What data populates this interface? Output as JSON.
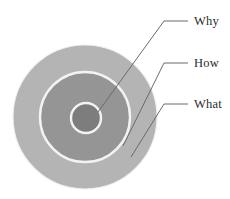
{
  "diagram": {
    "type": "concentric-circles",
    "background_color": "#ffffff",
    "center": {
      "x": 85,
      "y": 117
    },
    "ring_gap_color": "#f2f0ee",
    "rings": [
      {
        "id": "what",
        "label": "What",
        "level": 3,
        "radius": 72,
        "fill": "#b4b4b4",
        "stroke": "#f1efe9",
        "stroke_width": 1.4
      },
      {
        "id": "how",
        "label": "How",
        "level": 2,
        "radius": 45,
        "fill": "#959595",
        "stroke": "#f1efe9",
        "stroke_width": 2.2
      },
      {
        "id": "why",
        "label": "Why",
        "level": 1,
        "radius": 15,
        "fill": "#7d7d7d",
        "stroke": "#f1efe9",
        "stroke_width": 2.2
      }
    ],
    "leaders": [
      {
        "id": "why",
        "label": "Why",
        "line_color": "#6b6b6b",
        "line_width": 1,
        "anchor": {
          "x": 98,
          "y": 112
        },
        "elbow": {
          "x": 164,
          "y": 21
        },
        "end": {
          "x": 188,
          "y": 21
        },
        "text_x": 194,
        "text_y": 25
      },
      {
        "id": "how",
        "label": "How",
        "line_color": "#6b6b6b",
        "line_width": 1,
        "anchor": {
          "x": 123,
          "y": 146
        },
        "elbow": {
          "x": 164,
          "y": 63
        },
        "end": {
          "x": 188,
          "y": 63
        },
        "text_x": 194,
        "text_y": 67
      },
      {
        "id": "what",
        "label": "What",
        "line_color": "#6b6b6b",
        "line_width": 1,
        "anchor": {
          "x": 131,
          "y": 157
        },
        "elbow": {
          "x": 164,
          "y": 104
        },
        "end": {
          "x": 188,
          "y": 104
        },
        "text_x": 194,
        "text_y": 108
      }
    ]
  }
}
